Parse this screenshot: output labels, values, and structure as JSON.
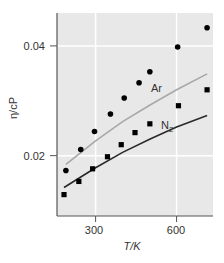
{
  "chart_data": {
    "type": "scatter",
    "title": "",
    "xlabel": "T/K",
    "ylabel": "η/cP",
    "xlim": [
      157,
      735
    ],
    "ylim": [
      0.009,
      0.046
    ],
    "xticks": [
      300,
      600
    ],
    "xtick_labels": [
      "300",
      "600"
    ],
    "yticks": [
      0.02,
      0.04
    ],
    "ytick_labels": [
      "0.02",
      "0.04"
    ],
    "grid": true,
    "legend": "inline labels",
    "series": [
      {
        "name": "Ar",
        "marker": "circle",
        "points": [
          [
            190,
            0.0173
          ],
          [
            245,
            0.0211
          ],
          [
            296,
            0.0244
          ],
          [
            355,
            0.0276
          ],
          [
            406,
            0.0305
          ],
          [
            461,
            0.0333
          ],
          [
            501,
            0.0353
          ],
          [
            604,
            0.0398
          ],
          [
            713,
            0.0433
          ]
        ],
        "curve": [
          [
            190,
            0.0184
          ],
          [
            300,
            0.0227
          ],
          [
            400,
            0.0262
          ],
          [
            500,
            0.0292
          ],
          [
            600,
            0.032
          ],
          [
            713,
            0.0349
          ]
        ],
        "curve_color": "#a8a8a8"
      },
      {
        "name": "N2",
        "marker": "square",
        "points": [
          [
            183,
            0.0129
          ],
          [
            238,
            0.0153
          ],
          [
            289,
            0.0176
          ],
          [
            344,
            0.0198
          ],
          [
            395,
            0.022
          ],
          [
            446,
            0.0242
          ],
          [
            501,
            0.0258
          ],
          [
            607,
            0.0291
          ],
          [
            713,
            0.032
          ]
        ],
        "curve": [
          [
            183,
            0.0142
          ],
          [
            300,
            0.0178
          ],
          [
            400,
            0.0206
          ],
          [
            500,
            0.023
          ],
          [
            600,
            0.0252
          ],
          [
            713,
            0.0273
          ]
        ],
        "curve_color": "#2a2a2a"
      }
    ]
  },
  "labels": {
    "ar": "Ar",
    "n2_main": "N",
    "n2_sub": "2",
    "xlabel": "T/K",
    "ylabel": "η/cP",
    "ytick_0": "0.02",
    "ytick_1": "0.04",
    "xtick_0": "300",
    "xtick_1": "600"
  },
  "colors": {
    "plot_bg": "#e8e8e8",
    "grid": "#ffffff",
    "axis": "#555555",
    "marker": "#000000"
  }
}
